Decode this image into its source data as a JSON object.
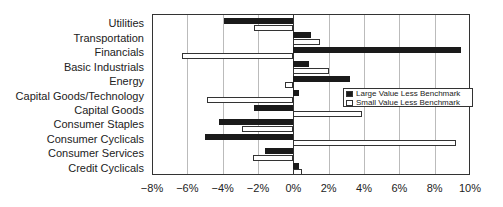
{
  "chart_data": {
    "type": "bar",
    "orientation": "horizontal",
    "title": "",
    "xlabel": "",
    "ylabel": "",
    "xlim": [
      -8,
      10
    ],
    "x_ticks": [
      "−8%",
      "−6%",
      "−4%",
      "−2%",
      "0%",
      "2%",
      "4%",
      "6%",
      "8%",
      "10%"
    ],
    "x_tick_values": [
      -8,
      -6,
      -4,
      -2,
      0,
      2,
      4,
      6,
      8,
      10
    ],
    "grid": "vertical",
    "legend_position": "inside-right",
    "categories": [
      "Utilities",
      "Transportation",
      "Financials",
      "Basic Industrials",
      "Energy",
      "Capital Goods/Technology",
      "Capital Goods",
      "Consumer Staples",
      "Consumer Cyclicals",
      "Consumer Services",
      "Credit Cyclicals"
    ],
    "series": [
      {
        "name": "Large Value Less Benchmark",
        "color": "#1a1a1a",
        "values": [
          -3.9,
          1.0,
          9.5,
          0.9,
          3.2,
          0.3,
          -2.2,
          -4.2,
          -5.0,
          -1.6,
          0.3
        ]
      },
      {
        "name": "Small Value Less Benchmark",
        "color": "#ffffff",
        "values": [
          -2.2,
          1.5,
          -6.3,
          2.0,
          -0.5,
          -4.9,
          3.9,
          -2.9,
          9.2,
          -2.3,
          0.5
        ]
      }
    ]
  }
}
